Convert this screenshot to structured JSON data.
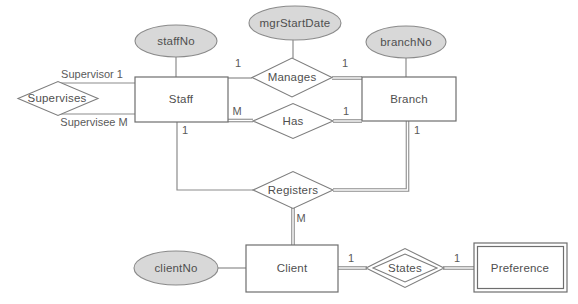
{
  "diagram_title": "ER diagram: Staff, Branch, Client, Preference",
  "colors": {
    "attribute_fill": "#d8d8d8",
    "attribute_stroke": "#8a8a8a",
    "entity_border": "#6e6e6e",
    "line": "#8c8c8c",
    "text": "#4f4f4f",
    "background": "#ffffff"
  },
  "entities": {
    "staff": "Staff",
    "branch": "Branch",
    "client": "Client",
    "preference": "Preference"
  },
  "attributes": {
    "staff_no": "staffNo",
    "mgr_start_date": "mgrStartDate",
    "branch_no": "branchNo",
    "client_no": "clientNo"
  },
  "relationships": {
    "supervises": "Supervises",
    "manages": "Manages",
    "has": "Has",
    "registers": "Registers",
    "states": "States"
  },
  "cardinalities": {
    "supervisor": "Supervisor 1",
    "supervisee": "Supervisee M",
    "staff_manages": "1",
    "manages_branch": "1",
    "staff_has": "M",
    "has_branch": "1",
    "staff_registers": "1",
    "branch_registers": "1",
    "registers_client": "M",
    "client_states": "1",
    "states_preference": "1"
  }
}
